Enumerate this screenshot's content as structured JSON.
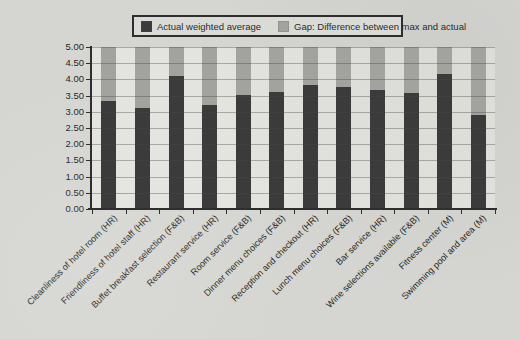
{
  "figure": {
    "background_color": "#d5d6d1",
    "plot_background_color": "#e3e3df"
  },
  "legend": {
    "items": [
      {
        "label": "Actual weighted average",
        "color": "#3b3b3b"
      },
      {
        "label": "Gap: Difference between max and actual",
        "color": "#a2a29f"
      }
    ]
  },
  "chart_data": {
    "type": "bar",
    "stacked": true,
    "title": "",
    "xlabel": "",
    "ylabel": "",
    "grid": true,
    "legend_position": "top-center",
    "ylim": [
      0,
      5
    ],
    "ytick_step": 0.5,
    "ytick_labels": [
      "0.00",
      "0.50",
      "1.00",
      "1.50",
      "2.00",
      "2.50",
      "3.00",
      "3.50",
      "4.00",
      "4.50",
      "5.00"
    ],
    "categories": [
      "Cleanliness of hotel room (HR)",
      "Friendliness of hotel staff (HR)",
      "Buffet breakfast selection (F&B)",
      "Restaurant service (HR)",
      "Room service (F&B)",
      "Dinner menu choices (F&B)",
      "Reception and checkout (HR)",
      "Lunch menu choices (F&B)",
      "Bar service (HR)",
      "Wine selections available (F&B)",
      "Fitness center (M)",
      "Swimming pool and area (M)"
    ],
    "series": [
      {
        "name": "Actual weighted average",
        "color": "#3b3b3b",
        "values": [
          3.32,
          3.12,
          4.12,
          3.22,
          3.53,
          3.61,
          3.84,
          3.78,
          3.68,
          3.57,
          4.16,
          2.9
        ]
      },
      {
        "name": "Gap: Difference between max and actual",
        "color": "#a2a29f",
        "values": [
          1.68,
          1.88,
          0.88,
          1.78,
          1.47,
          1.39,
          1.16,
          1.22,
          1.32,
          1.43,
          0.84,
          2.1
        ]
      }
    ]
  }
}
